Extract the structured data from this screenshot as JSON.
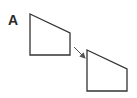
{
  "panel": {
    "label": "A"
  },
  "shapes": [
    {
      "name": "original-quadrilateral",
      "points": "30,14 70,33 70,55 30,55"
    },
    {
      "name": "translated-quadrilateral",
      "points": "87,50 127,69 127,91 87,91"
    }
  ],
  "arrow": {
    "x1": 74,
    "y1": 47,
    "x2": 85,
    "y2": 58
  },
  "colors": {
    "stroke": "#333333",
    "arrow": "#555555"
  }
}
